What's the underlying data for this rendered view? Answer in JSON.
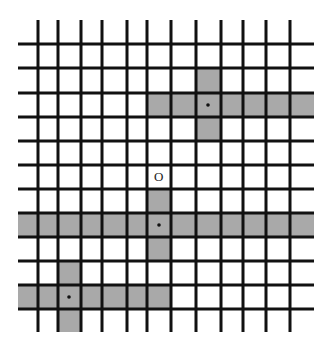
{
  "diagram": {
    "type": "grid-lattice",
    "colors": {
      "line": "#111111",
      "shade": "#a9a9a9",
      "background": "#ffffff",
      "dot": "#111111"
    },
    "vertical_lines_x": [
      38,
      58,
      81,
      102,
      127,
      147,
      171,
      196,
      221,
      243,
      266,
      290
    ],
    "horizontal_lines_y": [
      44,
      68,
      93,
      117,
      141,
      165,
      189,
      213,
      237,
      261,
      285,
      309
    ],
    "origin_label": "O",
    "shaded_regions": [
      {
        "name": "top-right-row",
        "x1": 147,
        "y1": 93,
        "x2": 314,
        "y2": 117
      },
      {
        "name": "top-right-col",
        "x1": 196,
        "y1": 68,
        "x2": 221,
        "y2": 141
      },
      {
        "name": "middle-row",
        "x1": 18,
        "y1": 213,
        "x2": 314,
        "y2": 237
      },
      {
        "name": "middle-col",
        "x1": 147,
        "y1": 189,
        "x2": 171,
        "y2": 261
      },
      {
        "name": "bottom-left-row",
        "x1": 18,
        "y1": 285,
        "x2": 171,
        "y2": 309
      },
      {
        "name": "bottom-left-col",
        "x1": 58,
        "y1": 261,
        "x2": 81,
        "y2": 332
      }
    ],
    "dots": [
      {
        "name": "dot-top-right",
        "x": 208,
        "y": 105
      },
      {
        "name": "dot-middle",
        "x": 159,
        "y": 225
      },
      {
        "name": "dot-bottom-left",
        "x": 69,
        "y": 297
      }
    ]
  }
}
